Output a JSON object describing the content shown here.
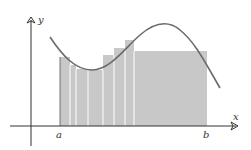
{
  "diagram": {
    "type": "riemann-sum",
    "axes": {
      "x_label": "x",
      "y_label": "y",
      "origin": [
        31,
        126
      ],
      "x_axis": {
        "from": 10,
        "to": 238
      },
      "y_axis": {
        "from": 146,
        "to": 18
      }
    },
    "interval": {
      "start_label": "a",
      "end_label": "b",
      "a_x": 60,
      "b_x": 207
    },
    "colors": {
      "rect_fill": "#c8c8c8",
      "rect_divider": "#ffffff",
      "curve": "#6b6b6b",
      "axis": "#333333"
    },
    "rectangles": [
      {
        "x0": 60,
        "x1": 70,
        "top": 57
      },
      {
        "x0": 70,
        "x1": 76,
        "top": 65
      },
      {
        "x0": 76,
        "x1": 88,
        "top": 69
      },
      {
        "x0": 88,
        "x1": 103,
        "top": 70
      },
      {
        "x0": 103,
        "x1": 114,
        "top": 55
      },
      {
        "x0": 114,
        "x1": 125,
        "top": 48
      },
      {
        "x0": 125,
        "x1": 134,
        "top": 40
      },
      {
        "x0": 134,
        "x1": 207,
        "top": 51
      }
    ],
    "curve_path": "M50,37 C62,55 75,70 92,70 C110,70 125,48 140,35 C155,22 168,20 180,30 C195,42 205,62 220,88"
  }
}
